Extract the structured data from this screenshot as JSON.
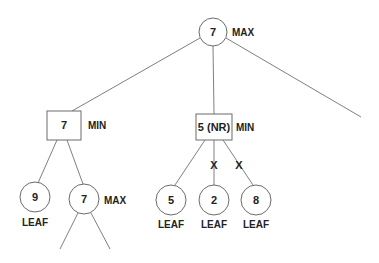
{
  "diagram": {
    "type": "minimax-tree",
    "nodes": {
      "root": {
        "value": "7",
        "type": "MAX"
      },
      "min_left": {
        "value": "7",
        "type": "MIN"
      },
      "min_mid": {
        "value": "5 (NR)",
        "type": "MIN"
      },
      "leaf_9": {
        "value": "9",
        "type": "LEAF"
      },
      "max_left": {
        "value": "7",
        "type": "MAX"
      },
      "leaf_5": {
        "value": "5",
        "type": "LEAF"
      },
      "leaf_2": {
        "value": "2",
        "type": "LEAF"
      },
      "leaf_8": {
        "value": "8",
        "type": "LEAF"
      }
    },
    "pruned_marks": [
      "X",
      "X"
    ],
    "edges": [
      [
        "root",
        "min_left"
      ],
      [
        "root",
        "min_mid"
      ],
      [
        "root",
        "unexpanded_right"
      ],
      [
        "min_left",
        "leaf_9"
      ],
      [
        "min_left",
        "max_left"
      ],
      [
        "max_left",
        "unexpanded_left"
      ],
      [
        "max_left",
        "unexpanded_right_2"
      ],
      [
        "min_mid",
        "leaf_5"
      ],
      [
        "min_mid",
        "leaf_2",
        "pruned"
      ],
      [
        "min_mid",
        "leaf_8",
        "pruned"
      ]
    ]
  }
}
